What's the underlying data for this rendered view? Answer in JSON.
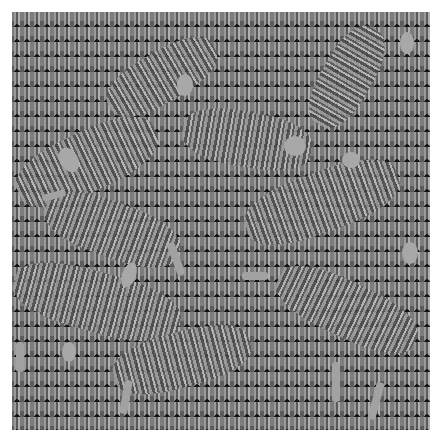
{
  "image": {
    "description": "Grayscale hidden-figure illusion pattern: repeating tiled texture with camouflaged figures",
    "colors": {
      "background": "#6e6e6e",
      "highlight": "#a8a8a8",
      "dark": "#151515"
    }
  }
}
